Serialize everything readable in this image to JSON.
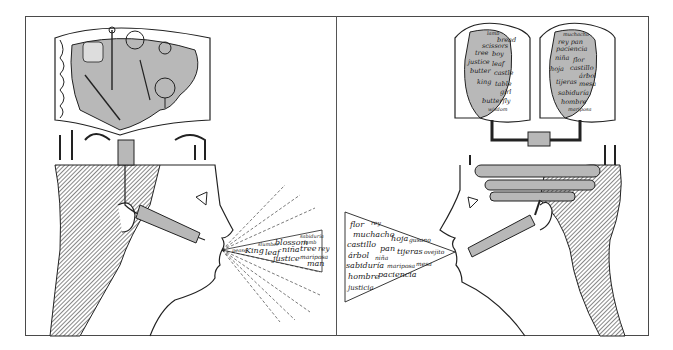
{
  "illustration": {
    "panels": [
      {
        "id": "left",
        "description": "Head with single brain jar of pictures; speech emits English words",
        "spoken_words": [
          "King",
          "leaf",
          "blossom",
          "justice",
          "niña",
          "tree",
          "rey",
          "mariposa",
          "man",
          "lamb",
          "sabiduría",
          "slumber"
        ],
        "brain_contents": "pictures"
      },
      {
        "id": "right",
        "description": "Head with two brain jars of words connected by pipes; speech emits Spanish words",
        "brain_jar_1_words": [
          "lamb",
          "bread",
          "scissors",
          "tree",
          "boy",
          "justice",
          "leaf",
          "butter",
          "castle",
          "king",
          "table",
          "girl",
          "butterfly",
          "wisdom"
        ],
        "brain_jar_2_words": [
          "muchacho",
          "rey",
          "pan",
          "paciencia",
          "niña",
          "flor",
          "hoja",
          "castillo",
          "árbol",
          "tijeras",
          "mesa",
          "sabiduría",
          "hombre",
          "mariposa"
        ],
        "spoken_words": [
          "flor",
          "rey",
          "muchacho",
          "hoja",
          "gusano",
          "castillo",
          "pan",
          "tijeras",
          "ovejito",
          "árbol",
          "niña",
          "sabiduría",
          "mariposa",
          "mesa",
          "hombre",
          "paciencia",
          "justicia"
        ]
      }
    ],
    "colors": {
      "ink": "#1a1a1a",
      "gray_fill": "#b8b8b8",
      "paper": "#ffffff"
    }
  }
}
